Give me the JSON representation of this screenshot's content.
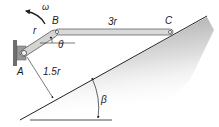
{
  "diagram": {
    "labels": {
      "omega": "ω",
      "point_a": "A",
      "point_b": "B",
      "point_c": "C",
      "link_ab": "r",
      "link_bc": "3r",
      "theta": "θ",
      "distance": "1.5r",
      "beta": "β"
    },
    "colors": {
      "link_fill": "#d9d9d9",
      "link_stroke": "#555555",
      "line": "#222222",
      "wall": "#6e6e6e",
      "shade_dark": "#9a9a9a"
    }
  }
}
